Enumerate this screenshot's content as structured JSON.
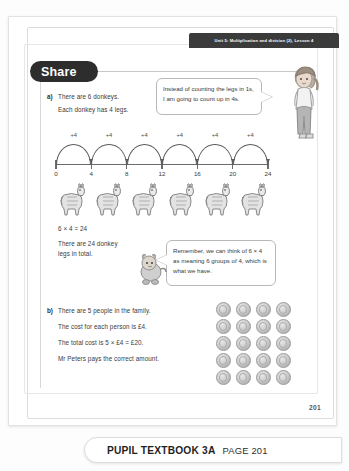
{
  "banner": {
    "unit_text": "Unit 5: Multiplication and division (2), Lesson 4"
  },
  "section": {
    "share_label": "Share"
  },
  "part_a": {
    "label": "a)",
    "line1": "There are 6 donkeys.",
    "line2": "Each donkey has 4 legs.",
    "equation": "6 × 4 = 24",
    "total_line1": "There are 24 donkey",
    "total_line2": "legs in total."
  },
  "part_b": {
    "label": "b)",
    "line1": "There are 5 people in the family.",
    "line2": "The cost for each person is £4.",
    "line3": "The total cost is 5 × £4 = £20.",
    "line4": "Mr Peters pays the correct amount."
  },
  "bubbles": {
    "girl": "Instead of counting the legs in 1s, I am going to count up in 4s.",
    "mascot": "Remember, we can think of 6 × 4 as meaning 6 groups of 4, which is what we have."
  },
  "chart_data": {
    "type": "line",
    "x": [
      0,
      4,
      8,
      12,
      16,
      20,
      24
    ],
    "tick_labels": [
      "0",
      "4",
      "8",
      "12",
      "16",
      "20",
      "24"
    ],
    "jump_labels": [
      "+4",
      "+4",
      "+4",
      "+4",
      "+4",
      "+4"
    ],
    "jump_count": 6,
    "step": 4,
    "xlim": [
      0,
      24
    ],
    "grid": false,
    "xlabel": "",
    "ylabel": ""
  },
  "donkeys": {
    "count": 6,
    "icon": "donkey-icon"
  },
  "coins": {
    "rows": 5,
    "cols": 4,
    "total": 20,
    "icon": "coin-icon"
  },
  "characters": {
    "girl": "girl-character-icon",
    "mascot": "mascot-character-icon"
  },
  "page": {
    "number": "201"
  },
  "footer": {
    "book": "PUPIL TEXTBOOK 3A",
    "page": "PAGE 201"
  },
  "colors": {
    "banner_bg": "#3b3b3b",
    "pill_bg": "#2d2d2d",
    "text": "#3a3a3a",
    "line": "#6b6b6b"
  }
}
